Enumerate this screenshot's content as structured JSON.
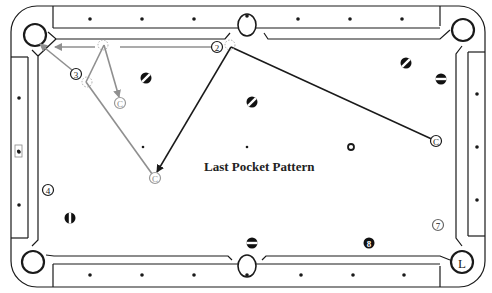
{
  "diagram": {
    "title": "Last Pocket Pattern",
    "colors": {
      "ink": "#1a1a1a",
      "shot_gray": "#8f8f8f",
      "background": "#ffffff"
    },
    "table": {
      "outer_rail": {
        "x": 11,
        "y": 6,
        "w": 474,
        "h": 281,
        "r": 26
      },
      "inner_rail": {
        "x": 28,
        "y": 22,
        "w": 440,
        "h": 249
      },
      "cushion": {
        "x": 38,
        "y": 33,
        "w": 420,
        "h": 226
      },
      "diamonds": {
        "top": [
          [
            90,
            19
          ],
          [
            142,
            19
          ],
          [
            194,
            19
          ],
          [
            298,
            19
          ],
          [
            350,
            19
          ],
          [
            402,
            19
          ]
        ],
        "bottom": [
          [
            90,
            275
          ],
          [
            142,
            275
          ],
          [
            194,
            275
          ],
          [
            301,
            275
          ],
          [
            353,
            275
          ],
          [
            404,
            275
          ]
        ],
        "left": [
          [
            19,
            98
          ],
          [
            19,
            152
          ],
          [
            19,
            205
          ]
        ],
        "right": [
          [
            477,
            94
          ],
          [
            477,
            147
          ],
          [
            477,
            200
          ]
        ]
      },
      "spots": [
        [
          143,
          147
        ],
        [
          247,
          147
        ]
      ],
      "label_box": {
        "x": 15,
        "y": 145,
        "w": 7,
        "h": 12
      }
    },
    "pockets": [
      {
        "id": "top-left",
        "cx": 35,
        "cy": 35
      },
      {
        "id": "top-center",
        "cx": 247,
        "cy": 25
      },
      {
        "id": "top-right",
        "cx": 463,
        "cy": 30
      },
      {
        "id": "bottom-left",
        "cx": 33,
        "cy": 262
      },
      {
        "id": "bottom-center",
        "cx": 247,
        "cy": 266
      },
      {
        "id": "bottom-right",
        "cx": 462,
        "cy": 262,
        "label": "L"
      }
    ],
    "balls": [
      {
        "label": "2",
        "x": 217,
        "y": 47,
        "style": "outline"
      },
      {
        "label": "3",
        "x": 76,
        "y": 74,
        "style": "outline"
      },
      {
        "label": "4",
        "x": 48,
        "y": 190,
        "style": "outline"
      },
      {
        "label": "7",
        "x": 438,
        "y": 225,
        "style": "outline-gray"
      },
      {
        "label": "8",
        "x": 369,
        "y": 243,
        "style": "solid-dark"
      },
      {
        "label": "",
        "x": 146,
        "y": 78,
        "style": "stripe"
      },
      {
        "label": "",
        "x": 406,
        "y": 63,
        "style": "stripe"
      },
      {
        "label": "",
        "x": 441,
        "y": 79,
        "style": "stripe-h"
      },
      {
        "label": "",
        "x": 252,
        "y": 102,
        "style": "stripe"
      },
      {
        "label": "",
        "x": 70,
        "y": 218,
        "style": "stripe-v"
      },
      {
        "label": "",
        "x": 252,
        "y": 243,
        "style": "stripe-h"
      },
      {
        "label": "",
        "x": 351,
        "y": 147,
        "style": "ring"
      }
    ],
    "cue_positions": [
      {
        "label": "C",
        "x": 120,
        "y": 103,
        "color": "gray"
      },
      {
        "label": "C",
        "x": 155,
        "y": 178,
        "color": "gray"
      },
      {
        "label": "C",
        "x": 436,
        "y": 141,
        "color": "dark"
      }
    ],
    "ghost_balls": [
      {
        "x": 103,
        "y": 45
      },
      {
        "x": 87,
        "y": 82
      },
      {
        "x": 230,
        "y": 45
      }
    ],
    "shots": [
      {
        "name": "cue-path-1-to-2",
        "points": [
          [
            436,
            141
          ],
          [
            231,
            47
          ]
        ],
        "color": "dark",
        "arrow": false
      },
      {
        "name": "cue-deflect-to-C",
        "points": [
          [
            231,
            47
          ],
          [
            157,
            172
          ]
        ],
        "color": "dark",
        "arrow": true
      },
      {
        "name": "object-2-to-pocket",
        "points": [
          [
            211,
            47
          ],
          [
            120,
            47
          ]
        ],
        "color": "gray",
        "arrow": false,
        "dashed": false
      },
      {
        "name": "object-line-1",
        "points": [
          [
            95,
            47
          ],
          [
            55,
            47
          ]
        ],
        "color": "gray",
        "arrow": true
      },
      {
        "name": "cue-C-to-ghost-3",
        "points": [
          [
            155,
            178
          ],
          [
            86,
            82
          ]
        ],
        "color": "gray",
        "arrow": false
      },
      {
        "name": "ghost-3-to-ghost-2",
        "points": [
          [
            86,
            82
          ],
          [
            104,
            45
          ]
        ],
        "color": "gray",
        "arrow": false
      },
      {
        "name": "ghost-to-C",
        "points": [
          [
            104,
            45
          ],
          [
            119,
            97
          ]
        ],
        "color": "gray",
        "arrow": true
      },
      {
        "name": "ball-3-to-pocket",
        "points": [
          [
            72,
            70
          ],
          [
            40,
            44
          ]
        ],
        "color": "gray",
        "arrow": true
      }
    ]
  }
}
